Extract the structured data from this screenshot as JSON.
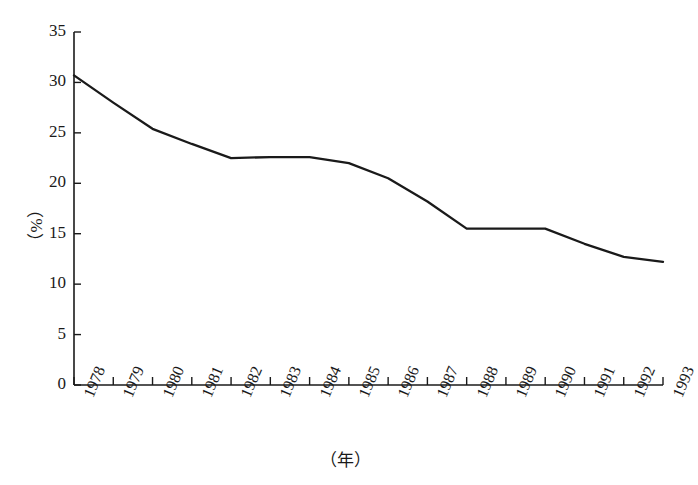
{
  "chart_data": {
    "type": "line",
    "title": "",
    "xlabel": "（年）",
    "ylabel": "（%）",
    "categories": [
      "1978",
      "1979",
      "1980",
      "1981",
      "1982",
      "1983",
      "1984",
      "1985",
      "1986",
      "1987",
      "1988",
      "1989",
      "1990",
      "1991",
      "1992",
      "1993"
    ],
    "values": [
      30.7,
      28.0,
      25.4,
      23.9,
      22.5,
      22.6,
      22.6,
      22.0,
      20.5,
      18.2,
      15.5,
      15.5,
      15.5,
      14.0,
      12.7,
      12.2
    ],
    "series": [
      {
        "name": "",
        "values": [
          30.7,
          28.0,
          25.4,
          23.9,
          22.5,
          22.6,
          22.6,
          22.0,
          20.5,
          18.2,
          15.5,
          15.5,
          15.5,
          14.0,
          12.7,
          12.2
        ]
      }
    ],
    "ylim": [
      0,
      35
    ],
    "yticks": [
      0,
      5,
      10,
      15,
      20,
      25,
      30,
      35
    ],
    "ytick_labels": [
      "0",
      "5",
      "10",
      "15",
      "20",
      "25",
      "30",
      "35"
    ],
    "grid": false,
    "legend": "none",
    "line_color": "#1a1a1a",
    "axis_color": "#1a1a1a",
    "background": "#ffffff"
  }
}
